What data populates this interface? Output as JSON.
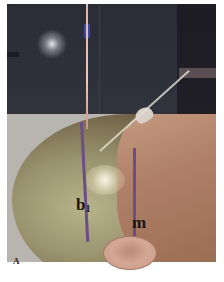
{
  "figure": {
    "panel_label": "A",
    "annotations": {
      "line_b1_label": "b",
      "line_b1_subscript": "1",
      "line_m_label": "m"
    },
    "colors": {
      "marker_line": "#6a4e88",
      "label_text": "#1a1612",
      "background": "#ffffff"
    }
  }
}
